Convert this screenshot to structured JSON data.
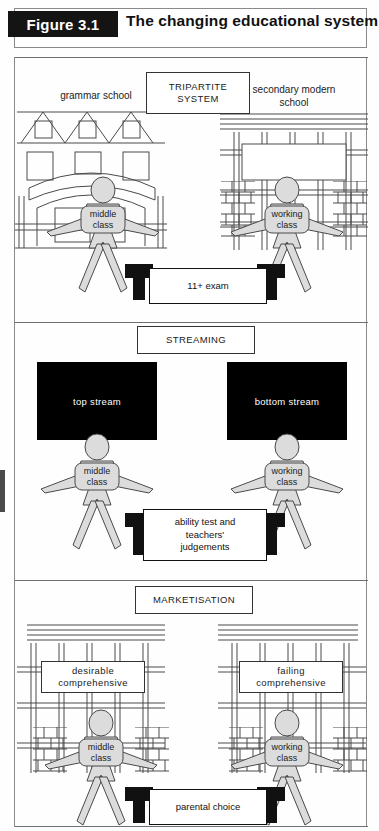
{
  "figure": {
    "tag": "Figure 3.1",
    "title": "The changing educational system"
  },
  "colors": {
    "frame": "#8a8a8a",
    "line": "#4a4a4a",
    "person_fill": "#dcdcdc",
    "stream_bg": "#000000",
    "stream_text": "#ffffff",
    "tag_bg": "#141414"
  },
  "panels": [
    {
      "id": "tripartite",
      "system_label": "TRIPARTITE SYSTEM",
      "left_school_label": "grammar school",
      "right_school_label": "secondary modern\nschool",
      "left_school_label_line1": "grammar school",
      "right_school_label_line1": "secondary modern",
      "right_school_label_line2": "school",
      "left_person": {
        "line1": "middle",
        "line2": "class"
      },
      "right_person": {
        "line1": "working",
        "line2": "class"
      },
      "arrow_label": "11+ exam"
    },
    {
      "id": "streaming",
      "system_label": "STREAMING",
      "left_stream": "top stream",
      "right_stream": "bottom stream",
      "left_person": {
        "line1": "middle",
        "line2": "class"
      },
      "right_person": {
        "line1": "working",
        "line2": "class"
      },
      "arrow_label_line1": "ability test and",
      "arrow_label_line2": "teachers'",
      "arrow_label_line3": "judgements"
    },
    {
      "id": "marketisation",
      "system_label": "MARKETISATION",
      "left_school_line1": "desirable",
      "left_school_line2": "comprehensive",
      "right_school_line1": "failing",
      "right_school_line2": "comprehensive",
      "left_person": {
        "line1": "middle",
        "line2": "class"
      },
      "right_person": {
        "line1": "working",
        "line2": "class"
      },
      "arrow_label": "parental choice"
    }
  ]
}
